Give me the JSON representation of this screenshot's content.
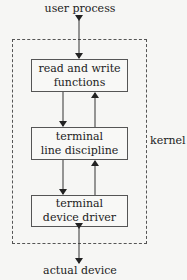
{
  "diagram": {
    "top_label": "user process",
    "bottom_label": "actual device",
    "region_label": "kernel",
    "boxes": [
      {
        "line1": "read and write",
        "line2": "functions"
      },
      {
        "line1": "terminal",
        "line2": "line discipline"
      },
      {
        "line1": "terminal",
        "line2": "device driver"
      }
    ],
    "edges": [
      {
        "from": "user process",
        "to": "read and write functions",
        "direction": "bidirectional"
      },
      {
        "from": "read and write functions",
        "to": "terminal line discipline",
        "direction": "down"
      },
      {
        "from": "terminal line discipline",
        "to": "read and write functions",
        "direction": "up"
      },
      {
        "from": "terminal line discipline",
        "to": "terminal device driver",
        "direction": "down"
      },
      {
        "from": "terminal device driver",
        "to": "terminal line discipline",
        "direction": "up"
      },
      {
        "from": "terminal device driver",
        "to": "actual device",
        "direction": "bidirectional"
      }
    ],
    "colors": {
      "background": "#f6f6f4",
      "stroke": "#555555",
      "text": "#222222"
    }
  }
}
